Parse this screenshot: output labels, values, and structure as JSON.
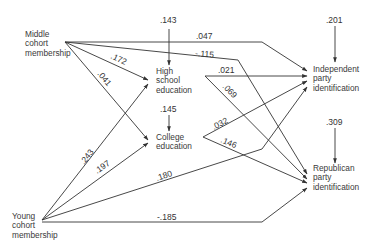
{
  "diagram": {
    "type": "path-diagram",
    "nodes": {
      "middle_cohort": {
        "lines": [
          "Middle",
          "cohort",
          "membership"
        ]
      },
      "young_cohort": {
        "lines": [
          "Young",
          "cohort",
          "membership"
        ]
      },
      "high_school": {
        "lines": [
          "High",
          "school",
          "education"
        ],
        "residual": ".143"
      },
      "college": {
        "lines": [
          "College",
          "education"
        ],
        "residual": ".145"
      },
      "independent": {
        "lines": [
          "Independent",
          "party",
          "identification"
        ],
        "residual": ".201"
      },
      "republican": {
        "lines": [
          "Republican",
          "party",
          "identification"
        ],
        "residual": ".309"
      }
    },
    "paths": [
      {
        "from": "middle_cohort",
        "to": "independent",
        "coef": ".047"
      },
      {
        "from": "middle_cohort",
        "to": "republican",
        "coef": "-.115"
      },
      {
        "from": "middle_cohort",
        "to": "high_school",
        "coef": ".172"
      },
      {
        "from": "middle_cohort",
        "to": "college",
        "coef": ".041"
      },
      {
        "from": "young_cohort",
        "to": "high_school",
        "coef": ".243"
      },
      {
        "from": "young_cohort",
        "to": "college",
        "coef": ".197"
      },
      {
        "from": "young_cohort",
        "to": "independent",
        "coef": ".180"
      },
      {
        "from": "young_cohort",
        "to": "republican",
        "coef": "-.185"
      },
      {
        "from": "high_school",
        "to": "independent",
        "coef": ".021"
      },
      {
        "from": "high_school",
        "to": "republican",
        "coef": ".069"
      },
      {
        "from": "college",
        "to": "independent",
        "coef": ".032"
      },
      {
        "from": "college",
        "to": "republican",
        "coef": ".146"
      }
    ]
  },
  "labels": {
    "c047": ".047",
    "c115": "-.115",
    "c172": ".172",
    "c041": ".041",
    "c243": ".243",
    "c197": ".197",
    "c180": ".180",
    "c185": "-.185",
    "c021": ".021",
    "c069": ".069",
    "c032": ".032",
    "c146": ".146",
    "r143": ".143",
    "r145": ".145",
    "r201": ".201",
    "r309": ".309"
  },
  "colors": {
    "line": "#333333",
    "text": "#3a3a3a",
    "background": "#ffffff"
  }
}
